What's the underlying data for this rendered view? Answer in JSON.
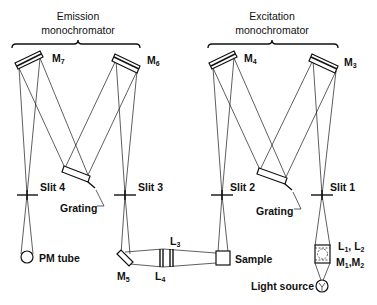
{
  "diagram": {
    "type": "optical-schematic",
    "groups": {
      "emission": {
        "title_line1": "Emission",
        "title_line2": "monochromator"
      },
      "excitation": {
        "title_line1": "Excitation",
        "title_line2": "monochromator"
      }
    },
    "mirrors": {
      "m7": {
        "base": "M",
        "sub": "7"
      },
      "m6": {
        "base": "M",
        "sub": "6"
      },
      "m4": {
        "base": "M",
        "sub": "4"
      },
      "m3": {
        "base": "M",
        "sub": "3"
      },
      "m5": {
        "base": "M",
        "sub": "5"
      }
    },
    "slits": {
      "slit4": "Slit 4",
      "slit3": "Slit 3",
      "slit2": "Slit 2",
      "slit1": "Slit 1"
    },
    "gratings": {
      "emission": "Grating",
      "excitation": "Grating"
    },
    "lenses": {
      "l3": {
        "base": "L",
        "sub": "3"
      },
      "l4": {
        "base": "L",
        "sub": "4"
      },
      "l1l2": {
        "a": "L",
        "a_sub": "1",
        "sep": ", ",
        "b": "L",
        "b_sub": "2"
      },
      "m1m2": {
        "a": "M",
        "a_sub": "1",
        "sep": ",",
        "b": "M",
        "b_sub": "2"
      }
    },
    "components": {
      "pm_tube": "PM tube",
      "sample": "Sample",
      "light_source": "Light source"
    },
    "colors": {
      "line": "#111111",
      "background": "#ffffff"
    }
  }
}
